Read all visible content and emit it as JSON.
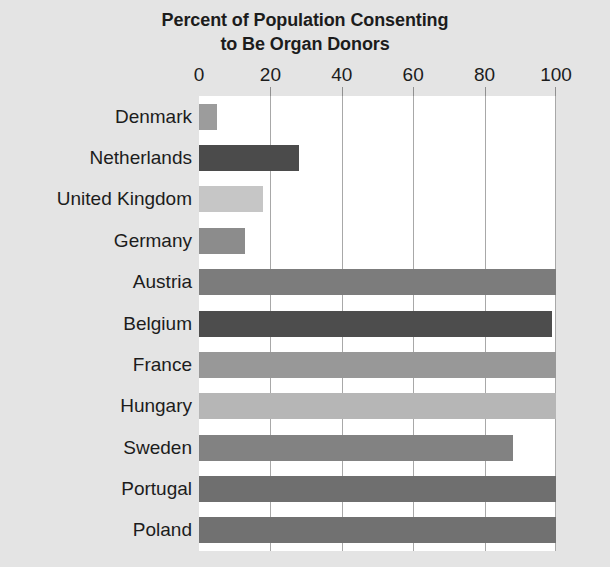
{
  "chart_data": {
    "type": "bar",
    "orientation": "horizontal",
    "title": "Percent of Population Consenting to Be Organ Donors",
    "title_line1": "Percent of Population Consenting",
    "title_line2": "to Be Organ Donors",
    "xlabel": "",
    "ylabel": "",
    "xlim": [
      0,
      100
    ],
    "xticks": [
      0,
      20,
      40,
      60,
      80,
      100
    ],
    "xtick_labels": [
      "0",
      "20",
      "40",
      "60",
      "80",
      "100"
    ],
    "grid": true,
    "grid_axis": "x",
    "legend": false,
    "axis_position": "top",
    "categories": [
      "Denmark",
      "Netherlands",
      "United Kingdom",
      "Germany",
      "Austria",
      "Belgium",
      "France",
      "Hungary",
      "Sweden",
      "Portugal",
      "Poland"
    ],
    "values": [
      5,
      28,
      18,
      13,
      100,
      99,
      100,
      100,
      88,
      100,
      100
    ],
    "bar_colors": [
      "#9c9c9c",
      "#4b4b4b",
      "#c6c6c6",
      "#8c8c8c",
      "#7c7c7c",
      "#4d4d4d",
      "#989898",
      "#b6b6b6",
      "#828282",
      "#6f6f6f",
      "#717171"
    ],
    "bars": [
      {
        "label": "Denmark",
        "value": 5,
        "color": "#9c9c9c"
      },
      {
        "label": "Netherlands",
        "value": 28,
        "color": "#4b4b4b"
      },
      {
        "label": "United Kingdom",
        "value": 18,
        "color": "#c6c6c6"
      },
      {
        "label": "Germany",
        "value": 13,
        "color": "#8c8c8c"
      },
      {
        "label": "Austria",
        "value": 100,
        "color": "#7c7c7c"
      },
      {
        "label": "Belgium",
        "value": 99,
        "color": "#4d4d4d"
      },
      {
        "label": "France",
        "value": 100,
        "color": "#989898"
      },
      {
        "label": "Hungary",
        "value": 100,
        "color": "#b6b6b6"
      },
      {
        "label": "Sweden",
        "value": 88,
        "color": "#828282"
      },
      {
        "label": "Portugal",
        "value": 100,
        "color": "#6f6f6f"
      },
      {
        "label": "Poland",
        "value": 100,
        "color": "#717171"
      }
    ],
    "colors": {
      "background": "#e4e4e4",
      "plot_background": "#ffffff",
      "gridline": "#a8a8a8",
      "text": "#1c1c1c"
    }
  }
}
